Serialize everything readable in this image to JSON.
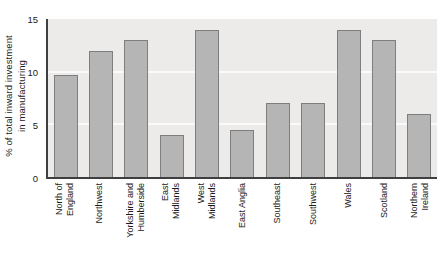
{
  "chart_data": {
    "type": "bar",
    "title": "",
    "xlabel": "",
    "ylabel": "% of total inward investment\nin manufacturing",
    "ylim": [
      0,
      15
    ],
    "yticks": [
      0,
      5,
      10,
      15
    ],
    "gridlines": [
      5,
      10
    ],
    "grid": "horizontal light lines on shaded plot area",
    "legend": "none",
    "categories": [
      "North of England",
      "Northwest",
      "Yorkshire and Humberside",
      "East Midlands",
      "West Midlands",
      "East Anglia",
      "Southeast",
      "Southwest",
      "Wales",
      "Scotland",
      "Northern Ireland"
    ],
    "category_label_lines": [
      "North of\nEngland",
      "Northwest",
      "Yorkshire and\nHumberside",
      "East\nMidlands",
      "West\nMidlands",
      "East Anglia",
      "Southeast",
      "Southwest",
      "Wales",
      "Scotland",
      "Northern\nIreland"
    ],
    "values": [
      9.7,
      12,
      13,
      4,
      14,
      4.5,
      7,
      7,
      14,
      13,
      6
    ],
    "colors": {
      "page_bg": "#ffffff",
      "plot_bg": "#edeaea",
      "bar_fill": "#b5b5b5",
      "bar_border": "#7e7e7e",
      "gridline": "#fbfafa",
      "axis": "#3f3f3f",
      "text": "#1a1a1a"
    }
  }
}
